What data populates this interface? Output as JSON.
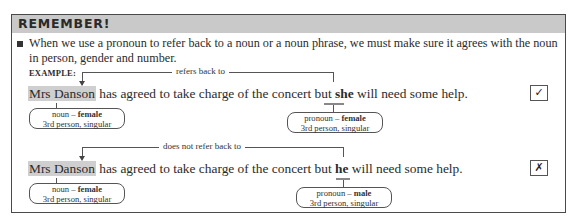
{
  "header": {
    "title": "REMEMBER!"
  },
  "rule": {
    "bullet_icon": "square-bullet",
    "text": "When we use a pronoun to refer back to a noun or a noun phrase, we must make sure it agrees with the noun in person, gender and number."
  },
  "example_label": "EXAMPLE:",
  "examples": [
    {
      "connector_label": "refers back to",
      "sentence": {
        "noun": "Mrs Danson",
        "middle": " has agreed to take charge of the concert but ",
        "pronoun": "she",
        "end": " will need some help."
      },
      "noun_tag": {
        "line1_prefix": "noun – ",
        "line1_bold": "female",
        "line2": "3rd person, singular"
      },
      "pronoun_tag": {
        "line1_prefix": "pronoun – ",
        "line1_bold": "female",
        "line2": "3rd person, singular"
      },
      "mark": {
        "icon": "check-icon",
        "glyph": "✓"
      }
    },
    {
      "connector_label": "does not refer back to",
      "sentence": {
        "noun": "Mrs Danson",
        "middle": " has agreed to take charge of the concert but ",
        "pronoun": "he",
        "end": " will need some help."
      },
      "noun_tag": {
        "line1_prefix": "noun – ",
        "line1_bold": "female",
        "line2": "3rd person, singular"
      },
      "pronoun_tag": {
        "line1_prefix": "pronoun – ",
        "line1_bold": "male",
        "line2": "3rd person, singular"
      },
      "mark": {
        "icon": "cross-icon",
        "glyph": "✗"
      }
    }
  ]
}
